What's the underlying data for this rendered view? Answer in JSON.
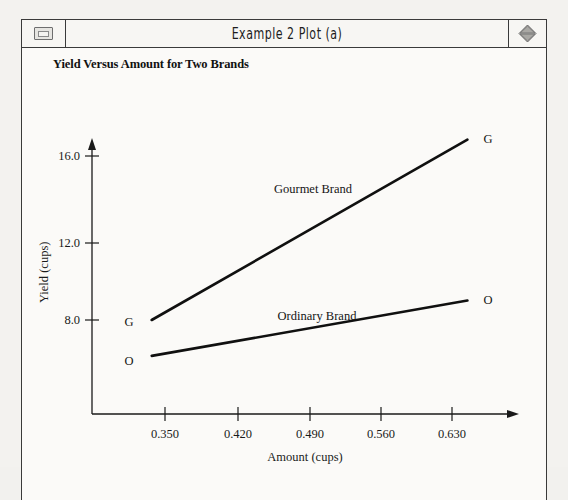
{
  "window": {
    "title": "Example 2 Plot (a)",
    "left_control_icon": "window-box-icon",
    "right_control_icon": "diamond-zoom-icon"
  },
  "chart_data": {
    "type": "line",
    "title": "Yield Versus Amount for Two Brands",
    "xlabel": "Amount (cups)",
    "ylabel": "Yield (cups)",
    "xlim": [
      0.315,
      0.665
    ],
    "ylim": [
      4.9,
      18.2
    ],
    "grid": false,
    "legend": "inline-annotations",
    "xticks": [
      "0.350",
      "0.420",
      "0.490",
      "0.560",
      "0.630"
    ],
    "xtick_values": [
      0.35,
      0.42,
      0.49,
      0.56,
      0.63
    ],
    "yticks": [
      "16.0",
      "12.0",
      "8.0"
    ],
    "ytick_values": [
      16.0,
      12.0,
      8.0
    ],
    "series": [
      {
        "name": "Gourmet Brand",
        "annotation": "Gourmet Brand",
        "marker_labels": [
          "G",
          "G"
        ],
        "x": [
          0.337,
          0.645
        ],
        "y": [
          8.0,
          16.8
        ]
      },
      {
        "name": "Ordinary Brand",
        "annotation": "Ordinary Brand",
        "marker_labels": [
          "O",
          "O"
        ],
        "x": [
          0.337,
          0.645
        ],
        "y": [
          6.25,
          8.95
        ]
      }
    ]
  },
  "colors": {
    "line": "#101010",
    "axis": "#1a1a1a",
    "window_bg": "#fbfaf8",
    "desktop_bg": "#f3f2ef",
    "frame": "#3a3a3a"
  }
}
